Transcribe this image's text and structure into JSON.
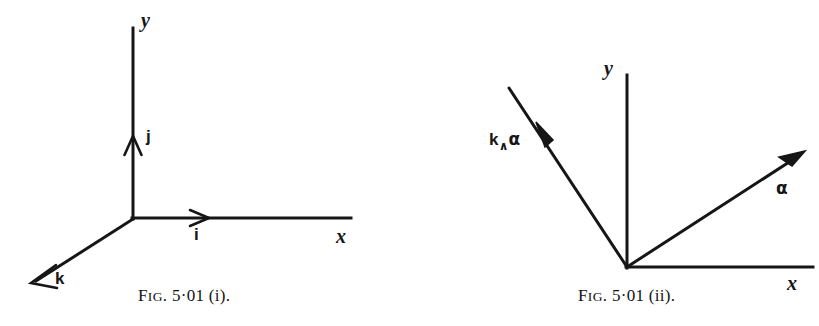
{
  "plate": {
    "name": "Fig. 5.01 vector diagrams plate",
    "background_color": "#ffffff",
    "ink_color": "#161616",
    "width": 819,
    "height": 326
  },
  "figures": [
    {
      "id": "fig-i",
      "caption_prefix": "F",
      "caption_smallcaps": "IG",
      "caption_rest": ". 5·01 (i).",
      "caption_full": "FIG. 5·01 (i).",
      "description": "Right-handed three-dimensional Cartesian axes with unit vectors i, j, k",
      "origin": {
        "x": 133,
        "y": 218
      },
      "axes": [
        {
          "name": "y-axis",
          "label": "y",
          "from": [
            133,
            218
          ],
          "to": [
            133,
            28
          ]
        },
        {
          "name": "x-axis",
          "label": "x",
          "from": [
            133,
            218
          ],
          "to": [
            350,
            218
          ]
        },
        {
          "name": "z-axis",
          "label": "k",
          "from": [
            133,
            218
          ],
          "to": [
            32,
            283
          ]
        }
      ],
      "axis_labels": [
        {
          "name": "y-axis-label",
          "text": "y",
          "x": 141,
          "y": 12
        },
        {
          "name": "x-axis-label",
          "text": "x",
          "x": 336,
          "y": 228
        }
      ],
      "vector_labels": [
        {
          "name": "unit-vector-j-label",
          "text": "j",
          "x": 146,
          "y": 130
        },
        {
          "name": "unit-vector-i-label",
          "text": "i",
          "x": 193,
          "y": 228
        },
        {
          "name": "unit-vector-k-label",
          "text": "k",
          "x": 55,
          "y": 272
        }
      ]
    },
    {
      "id": "fig-ii",
      "caption_prefix": "F",
      "caption_smallcaps": "IG",
      "caption_rest": ". 5·01 (ii).",
      "caption_full": "FIG. 5·01 (ii).",
      "description": "Two plane vectors a and k wedge a drawn from a common origin with x and y axes",
      "origin": {
        "x": 627,
        "y": 267
      },
      "axes": [
        {
          "name": "y-axis",
          "label": "y",
          "from": [
            627,
            267
          ],
          "to": [
            627,
            75
          ]
        },
        {
          "name": "x-axis",
          "label": "x",
          "from": [
            627,
            267
          ],
          "to": [
            812,
            267
          ]
        }
      ],
      "axis_labels": [
        {
          "name": "y-axis-label",
          "text": "y",
          "x": 605,
          "y": 60
        },
        {
          "name": "x-axis-label",
          "text": "x",
          "x": 787,
          "y": 275
        }
      ],
      "vectors": [
        {
          "name": "vector-alpha",
          "label": "α",
          "from": [
            627,
            267
          ],
          "to": [
            802,
            153
          ]
        },
        {
          "name": "vector-k-wedge-alpha",
          "label": "k∧α",
          "from": [
            627,
            267
          ],
          "to": [
            508,
            87
          ]
        }
      ],
      "vector_labels": [
        {
          "name": "vector-alpha-label",
          "text": "α",
          "x": 775,
          "y": 182
        },
        {
          "name": "vector-k-wedge-alpha-label",
          "k_text": "k",
          "wedge_text": "∧",
          "alpha_text": "α",
          "x": 489,
          "y": 133
        }
      ]
    }
  ],
  "captions": [
    {
      "name": "caption-fig-i",
      "x": 138,
      "y": 288,
      "prefix": "F",
      "smallcaps": "IG",
      "rest": ". 5·01 (i)."
    },
    {
      "name": "caption-fig-ii",
      "x": 578,
      "y": 288,
      "prefix": "F",
      "smallcaps": "IG",
      "rest": ". 5·01 (ii)."
    }
  ]
}
